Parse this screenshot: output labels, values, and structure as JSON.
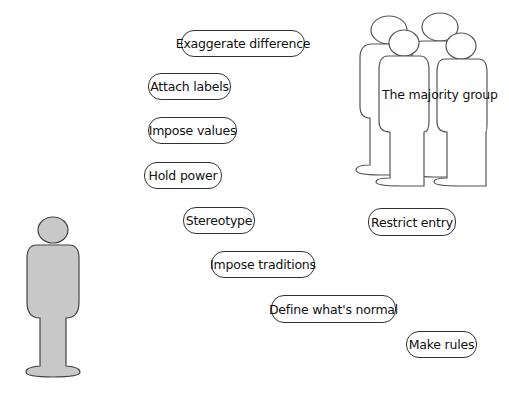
{
  "diagram": {
    "majority_group": {
      "label": "The majority group",
      "figure_count": 4,
      "fill": "#ffffff",
      "stroke": "#555555"
    },
    "minority_figure": {
      "fill": "#c8c8c8",
      "stroke": "#444444"
    },
    "actions": [
      {
        "label": "Exaggerate difference",
        "x": 181,
        "y": 30,
        "w": 124,
        "h": 27
      },
      {
        "label": "Attach labels",
        "x": 148,
        "y": 73,
        "w": 83,
        "h": 27
      },
      {
        "label": "Impose values",
        "x": 148,
        "y": 117,
        "w": 89,
        "h": 27
      },
      {
        "label": "Hold power",
        "x": 144,
        "y": 162,
        "w": 78,
        "h": 27
      },
      {
        "label": "Stereotype",
        "x": 183,
        "y": 207,
        "w": 72,
        "h": 27
      },
      {
        "label": "Restrict entry",
        "x": 368,
        "y": 208,
        "w": 88,
        "h": 28
      },
      {
        "label": "Impose traditions",
        "x": 211,
        "y": 251,
        "w": 104,
        "h": 27
      },
      {
        "label": "Define what's normal",
        "x": 271,
        "y": 295,
        "w": 125,
        "h": 28
      },
      {
        "label": "Make rules",
        "x": 406,
        "y": 331,
        "w": 71,
        "h": 27
      }
    ]
  }
}
